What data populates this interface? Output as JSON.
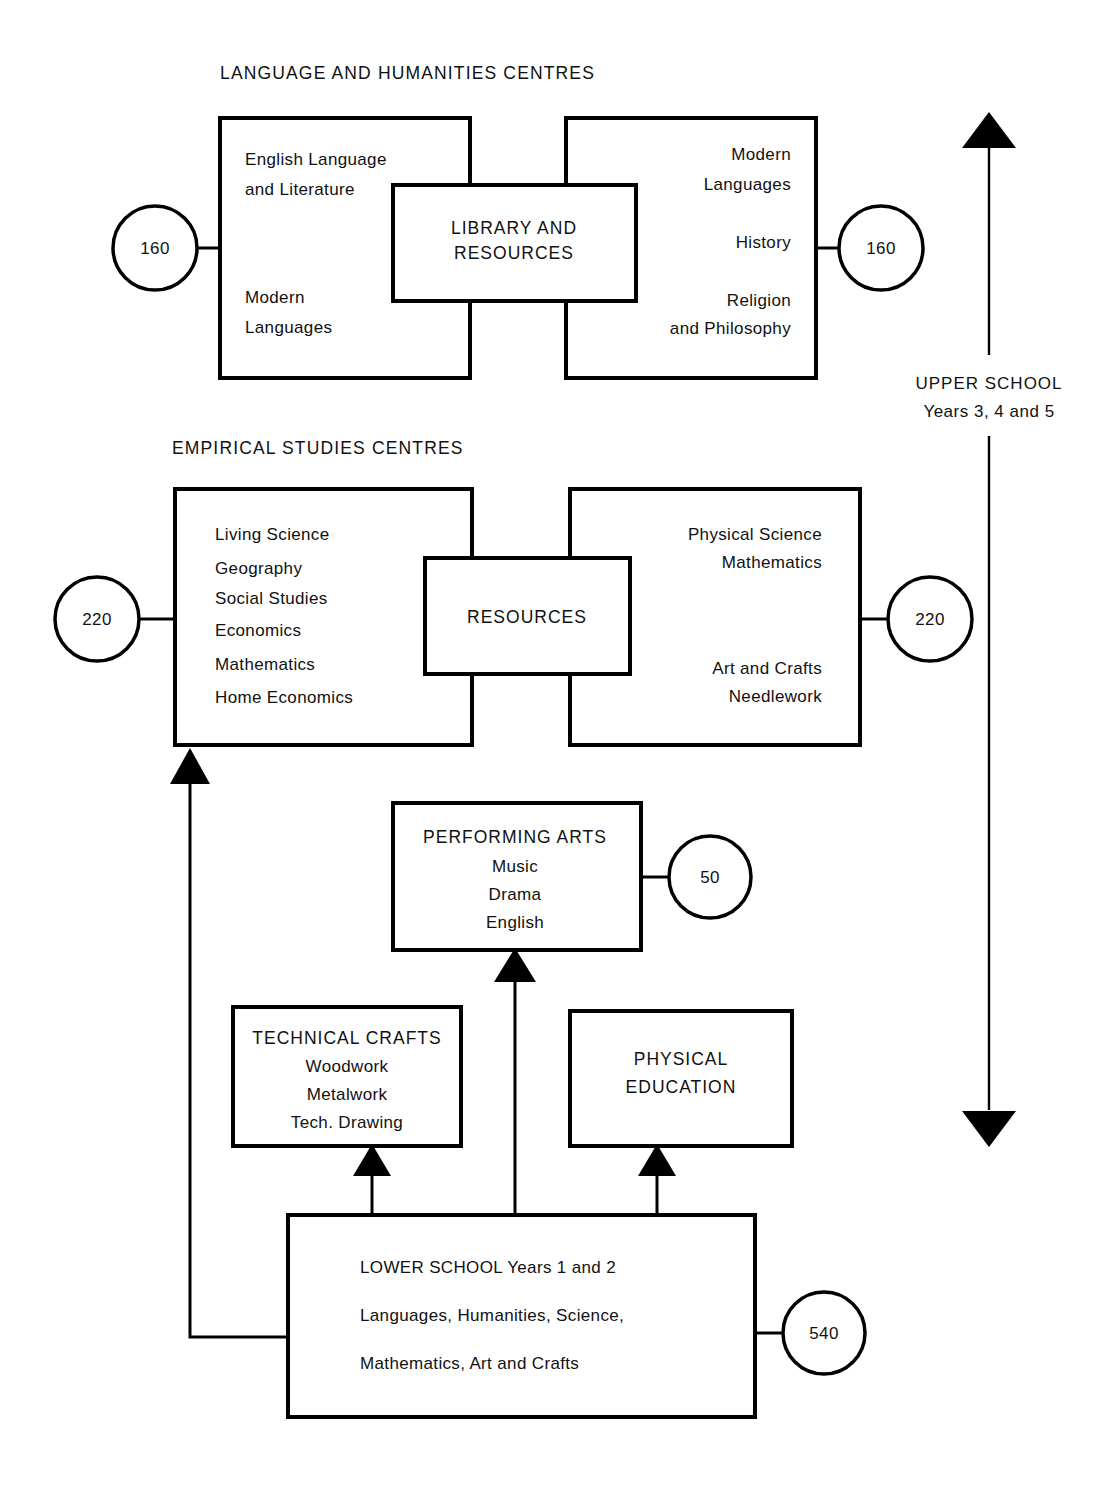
{
  "diagram": {
    "title_language": "LANGUAGE AND HUMANITIES CENTRES",
    "title_empirical": "EMPIRICAL STUDIES CENTRES",
    "language_left": {
      "line1": "English Language",
      "line2": "and Literature",
      "line3": "Modern",
      "line4": "Languages"
    },
    "language_centre": {
      "line1": "LIBRARY AND",
      "line2": "RESOURCES"
    },
    "language_right": {
      "line1": "Modern",
      "line2": "Languages",
      "line3": "History",
      "line4": "Religion",
      "line5": "and Philosophy"
    },
    "empirical_left": {
      "line1": "Living Science",
      "line2": "Geography",
      "line3": "Social Studies",
      "line4": "Economics",
      "line5": "Mathematics",
      "line6": "Home Economics"
    },
    "empirical_centre": {
      "line1": "RESOURCES"
    },
    "empirical_right": {
      "line1": "Physical Science",
      "line2": "Mathematics",
      "line3": "Art and Crafts",
      "line4": "Needlework"
    },
    "performing_arts": {
      "line1": "PERFORMING ARTS",
      "line2": "Music",
      "line3": "Drama",
      "line4": "English"
    },
    "technical_crafts": {
      "line1": "TECHNICAL CRAFTS",
      "line2": "Woodwork",
      "line3": "Metalwork",
      "line4": "Tech. Drawing"
    },
    "physical_education": {
      "line1": "PHYSICAL",
      "line2": "EDUCATION"
    },
    "lower_school": {
      "line1": "LOWER SCHOOL  Years 1 and 2",
      "line2": "Languages, Humanities, Science,",
      "line3": "Mathematics, Art and Crafts"
    },
    "upper_school_label": {
      "line1": "UPPER SCHOOL",
      "line2": "Years 3, 4 and 5"
    },
    "counts": {
      "language_left": "160",
      "language_right": "160",
      "empirical_left": "220",
      "empirical_right": "220",
      "performing_arts": "50",
      "lower_school": "540"
    },
    "colors": {
      "stroke": "#000000",
      "background": "#ffffff",
      "text": "#111111"
    }
  }
}
